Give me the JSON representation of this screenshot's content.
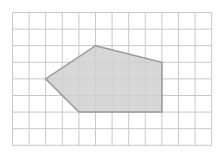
{
  "diagram": {
    "type": "polygon-on-grid",
    "grid": {
      "columns": 12,
      "rows": 8,
      "cell_size": 16.6,
      "origin": [
        12.5,
        12.5
      ],
      "line_color": "#c8c8c8"
    },
    "polygon": {
      "vertices_grid": [
        [
          5,
          2
        ],
        [
          9,
          3
        ],
        [
          9,
          6
        ],
        [
          4,
          6
        ],
        [
          2,
          4
        ]
      ],
      "fill": "#d0d0d0",
      "stroke": "#9a9a9a"
    }
  }
}
